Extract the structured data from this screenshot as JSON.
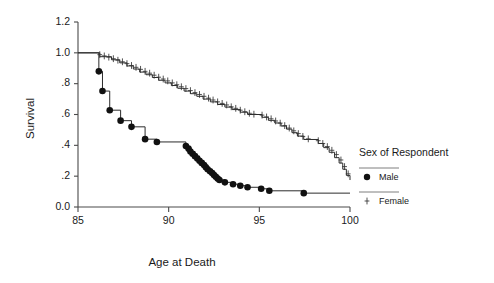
{
  "chart_data": {
    "type": "line",
    "title": "",
    "xlabel": "Age at Death",
    "ylabel": "Survival",
    "xlim": [
      85,
      100
    ],
    "ylim": [
      0.0,
      1.2
    ],
    "xticks": [
      85,
      90,
      95,
      100
    ],
    "xtick_labels": [
      "85",
      "90",
      "95",
      "100"
    ],
    "yticks": [
      0.0,
      0.2,
      0.4,
      0.6,
      0.8,
      1.0,
      1.2
    ],
    "ytick_labels": [
      "0.0",
      ".2",
      ".4",
      ".6",
      ".8",
      "1.0",
      "1.2"
    ],
    "grid": false,
    "legend": {
      "title": "Sex of Respondent",
      "position": "right",
      "entries": [
        {
          "label": "Male",
          "marker": "dot"
        },
        {
          "label": "Female",
          "marker": "plus"
        }
      ]
    },
    "series": [
      {
        "name": "Male",
        "marker": "dot",
        "points": [
          [
            85.0,
            1.0
          ],
          [
            86.15,
            1.0
          ],
          [
            86.15,
            0.88
          ],
          [
            86.35,
            0.88
          ],
          [
            86.35,
            0.752
          ],
          [
            86.75,
            0.752
          ],
          [
            86.75,
            0.628
          ],
          [
            87.35,
            0.628
          ],
          [
            87.35,
            0.56
          ],
          [
            87.95,
            0.56
          ],
          [
            87.95,
            0.52
          ],
          [
            88.7,
            0.52
          ],
          [
            88.7,
            0.44
          ],
          [
            89.35,
            0.44
          ],
          [
            89.35,
            0.422
          ],
          [
            90.95,
            0.422
          ],
          [
            90.95,
            0.395
          ],
          [
            91.2,
            0.395
          ],
          [
            91.2,
            0.36
          ],
          [
            91.45,
            0.36
          ],
          [
            91.45,
            0.33
          ],
          [
            91.7,
            0.33
          ],
          [
            91.7,
            0.3
          ],
          [
            91.95,
            0.3
          ],
          [
            91.95,
            0.272
          ],
          [
            92.15,
            0.272
          ],
          [
            92.15,
            0.245
          ],
          [
            92.4,
            0.245
          ],
          [
            92.4,
            0.22
          ],
          [
            92.6,
            0.22
          ],
          [
            92.6,
            0.196
          ],
          [
            92.8,
            0.196
          ],
          [
            92.8,
            0.175
          ],
          [
            93.1,
            0.175
          ],
          [
            93.1,
            0.16
          ],
          [
            93.55,
            0.16
          ],
          [
            93.55,
            0.148
          ],
          [
            93.95,
            0.148
          ],
          [
            93.95,
            0.138
          ],
          [
            94.35,
            0.138
          ],
          [
            94.35,
            0.128
          ],
          [
            95.1,
            0.128
          ],
          [
            95.1,
            0.118
          ],
          [
            95.55,
            0.118
          ],
          [
            95.55,
            0.105
          ],
          [
            97.45,
            0.105
          ],
          [
            97.45,
            0.09
          ],
          [
            100.0,
            0.09
          ]
        ],
        "event_markers": [
          [
            86.15,
            0.88
          ],
          [
            86.35,
            0.752
          ],
          [
            86.75,
            0.628
          ],
          [
            87.35,
            0.56
          ],
          [
            87.95,
            0.52
          ],
          [
            88.7,
            0.44
          ],
          [
            89.35,
            0.422
          ],
          [
            90.95,
            0.395
          ],
          [
            91.1,
            0.378
          ],
          [
            91.2,
            0.36
          ],
          [
            91.32,
            0.345
          ],
          [
            91.45,
            0.33
          ],
          [
            91.58,
            0.315
          ],
          [
            91.7,
            0.3
          ],
          [
            91.82,
            0.286
          ],
          [
            91.95,
            0.272
          ],
          [
            92.05,
            0.258
          ],
          [
            92.15,
            0.245
          ],
          [
            92.28,
            0.232
          ],
          [
            92.4,
            0.22
          ],
          [
            92.5,
            0.208
          ],
          [
            92.6,
            0.196
          ],
          [
            92.7,
            0.185
          ],
          [
            92.8,
            0.175
          ],
          [
            93.1,
            0.16
          ],
          [
            93.55,
            0.148
          ],
          [
            93.95,
            0.138
          ],
          [
            94.35,
            0.128
          ],
          [
            95.1,
            0.118
          ],
          [
            95.55,
            0.105
          ],
          [
            97.45,
            0.09
          ]
        ]
      },
      {
        "name": "Female",
        "marker": "plus",
        "points": [
          [
            85.0,
            1.0
          ],
          [
            86.2,
            1.0
          ],
          [
            86.2,
            0.975
          ],
          [
            86.85,
            0.975
          ],
          [
            86.85,
            0.955
          ],
          [
            87.3,
            0.955
          ],
          [
            87.3,
            0.935
          ],
          [
            87.7,
            0.935
          ],
          [
            87.7,
            0.915
          ],
          [
            88.05,
            0.915
          ],
          [
            88.05,
            0.895
          ],
          [
            88.4,
            0.895
          ],
          [
            88.4,
            0.875
          ],
          [
            88.75,
            0.875
          ],
          [
            88.75,
            0.858
          ],
          [
            89.1,
            0.858
          ],
          [
            89.1,
            0.84
          ],
          [
            89.45,
            0.84
          ],
          [
            89.45,
            0.822
          ],
          [
            89.8,
            0.822
          ],
          [
            89.8,
            0.805
          ],
          [
            90.15,
            0.805
          ],
          [
            90.15,
            0.788
          ],
          [
            90.5,
            0.788
          ],
          [
            90.5,
            0.77
          ],
          [
            90.85,
            0.77
          ],
          [
            90.85,
            0.752
          ],
          [
            91.2,
            0.752
          ],
          [
            91.2,
            0.735
          ],
          [
            91.55,
            0.735
          ],
          [
            91.55,
            0.718
          ],
          [
            91.9,
            0.718
          ],
          [
            91.9,
            0.7
          ],
          [
            92.3,
            0.7
          ],
          [
            92.3,
            0.682
          ],
          [
            92.7,
            0.682
          ],
          [
            92.7,
            0.665
          ],
          [
            93.1,
            0.665
          ],
          [
            93.1,
            0.648
          ],
          [
            93.5,
            0.648
          ],
          [
            93.5,
            0.632
          ],
          [
            93.95,
            0.632
          ],
          [
            93.95,
            0.615
          ],
          [
            94.35,
            0.615
          ],
          [
            94.35,
            0.6
          ],
          [
            95.15,
            0.6
          ],
          [
            95.15,
            0.582
          ],
          [
            95.5,
            0.582
          ],
          [
            95.5,
            0.562
          ],
          [
            95.85,
            0.562
          ],
          [
            95.85,
            0.545
          ],
          [
            96.2,
            0.545
          ],
          [
            96.2,
            0.525
          ],
          [
            96.5,
            0.525
          ],
          [
            96.5,
            0.505
          ],
          [
            96.8,
            0.505
          ],
          [
            96.8,
            0.482
          ],
          [
            97.1,
            0.482
          ],
          [
            97.1,
            0.46
          ],
          [
            97.45,
            0.46
          ],
          [
            97.45,
            0.438
          ],
          [
            98.25,
            0.438
          ],
          [
            98.25,
            0.412
          ],
          [
            98.55,
            0.412
          ],
          [
            98.55,
            0.385
          ],
          [
            98.85,
            0.385
          ],
          [
            98.85,
            0.355
          ],
          [
            99.15,
            0.355
          ],
          [
            99.15,
            0.32
          ],
          [
            99.4,
            0.32
          ],
          [
            99.4,
            0.285
          ],
          [
            99.6,
            0.285
          ],
          [
            99.6,
            0.245
          ],
          [
            99.8,
            0.245
          ],
          [
            99.8,
            0.205
          ],
          [
            100.0,
            0.205
          ],
          [
            100.0,
            0.175
          ]
        ],
        "censor_markers": [
          [
            86.2,
            0.988
          ],
          [
            86.45,
            0.98
          ],
          [
            86.7,
            0.972
          ],
          [
            86.95,
            0.962
          ],
          [
            87.2,
            0.952
          ],
          [
            87.45,
            0.942
          ],
          [
            87.7,
            0.93
          ],
          [
            87.95,
            0.918
          ],
          [
            88.2,
            0.906
          ],
          [
            88.45,
            0.893
          ],
          [
            88.7,
            0.88
          ],
          [
            88.95,
            0.868
          ],
          [
            89.2,
            0.855
          ],
          [
            89.45,
            0.842
          ],
          [
            89.7,
            0.83
          ],
          [
            89.95,
            0.818
          ],
          [
            90.2,
            0.805
          ],
          [
            90.45,
            0.793
          ],
          [
            90.7,
            0.78
          ],
          [
            90.95,
            0.768
          ],
          [
            91.2,
            0.755
          ],
          [
            91.45,
            0.742
          ],
          [
            91.7,
            0.73
          ],
          [
            91.95,
            0.718
          ],
          [
            92.2,
            0.706
          ],
          [
            92.45,
            0.694
          ],
          [
            92.7,
            0.682
          ],
          [
            92.95,
            0.672
          ],
          [
            93.2,
            0.662
          ],
          [
            93.45,
            0.65
          ],
          [
            93.7,
            0.64
          ],
          [
            93.95,
            0.628
          ],
          [
            94.2,
            0.618
          ],
          [
            94.45,
            0.608
          ],
          [
            94.7,
            0.602
          ],
          [
            95.15,
            0.596
          ],
          [
            95.4,
            0.584
          ],
          [
            95.65,
            0.572
          ],
          [
            95.9,
            0.558
          ],
          [
            96.15,
            0.544
          ],
          [
            96.4,
            0.528
          ],
          [
            96.65,
            0.512
          ],
          [
            96.9,
            0.494
          ],
          [
            97.15,
            0.476
          ],
          [
            97.4,
            0.458
          ],
          [
            97.7,
            0.442
          ],
          [
            98.25,
            0.43
          ],
          [
            98.5,
            0.412
          ],
          [
            98.75,
            0.392
          ],
          [
            99.0,
            0.368
          ],
          [
            99.25,
            0.34
          ],
          [
            99.5,
            0.305
          ],
          [
            99.7,
            0.262
          ],
          [
            99.9,
            0.215
          ]
        ]
      }
    ]
  }
}
